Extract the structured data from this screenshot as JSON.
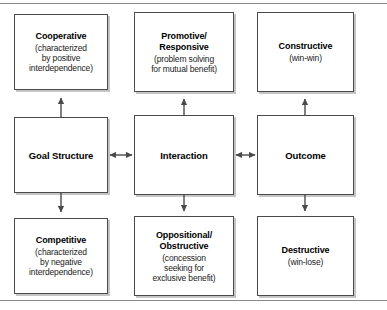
{
  "figure": {
    "type": "flow-diagram",
    "accent_color": "#4a4a4a",
    "background": "#ffffff"
  },
  "nodes": {
    "cooperative": {
      "id": "cooperative",
      "title": "Cooperative",
      "sub_line_1": "(characterized",
      "sub_line_2": "by positive",
      "sub_line_3": "interdependence)",
      "column": "goal-structure",
      "row": "top"
    },
    "goal_structure": {
      "id": "goal-structure",
      "title": "Goal Structure",
      "column": "goal-structure",
      "row": "middle"
    },
    "competitive": {
      "id": "competitive",
      "title": "Competitive",
      "sub_line_1": "(characterized",
      "sub_line_2": "by negative",
      "sub_line_3": "interdependence)",
      "column": "goal-structure",
      "row": "bottom"
    },
    "promotive": {
      "id": "promotive-responsive",
      "title_line_1": "Promotive/",
      "title_line_2": "Responsive",
      "sub_line_1": "(problem solving",
      "sub_line_2": "for mutual benefit)",
      "column": "interaction",
      "row": "top"
    },
    "interaction": {
      "id": "interaction",
      "title": "Interaction",
      "column": "interaction",
      "row": "middle"
    },
    "oppositional": {
      "id": "oppositional-obstructive",
      "title_line_1": "Oppositional/",
      "title_line_2": "Obstructive",
      "sub_line_1": "(concession",
      "sub_line_2": "seeking for",
      "sub_line_3": "exclusive benefit)",
      "column": "interaction",
      "row": "bottom"
    },
    "constructive": {
      "id": "constructive",
      "title": "Constructive",
      "sub_line_1": "(win-win)",
      "column": "outcome",
      "row": "top"
    },
    "outcome": {
      "id": "outcome",
      "title": "Outcome",
      "column": "outcome",
      "row": "middle"
    },
    "destructive": {
      "id": "destructive",
      "title": "Destructive",
      "sub_line_1": "(win-lose)",
      "column": "outcome",
      "row": "bottom"
    }
  },
  "connectors": [
    {
      "id": "goal-structure-to-cooperative",
      "direction": "up",
      "from": "goal_structure",
      "to": "cooperative"
    },
    {
      "id": "goal-structure-to-competitive",
      "direction": "down",
      "from": "goal_structure",
      "to": "competitive"
    },
    {
      "id": "interaction-to-promotive",
      "direction": "up",
      "from": "interaction",
      "to": "promotive"
    },
    {
      "id": "interaction-to-oppositional",
      "direction": "down",
      "from": "interaction",
      "to": "oppositional"
    },
    {
      "id": "outcome-to-constructive",
      "direction": "up",
      "from": "outcome",
      "to": "constructive"
    },
    {
      "id": "outcome-to-destructive",
      "direction": "down",
      "from": "outcome",
      "to": "destructive"
    },
    {
      "id": "goal-structure-interaction",
      "direction": "bidirectional",
      "from": "goal_structure",
      "to": "interaction"
    },
    {
      "id": "interaction-outcome",
      "direction": "bidirectional",
      "from": "interaction",
      "to": "outcome"
    }
  ]
}
